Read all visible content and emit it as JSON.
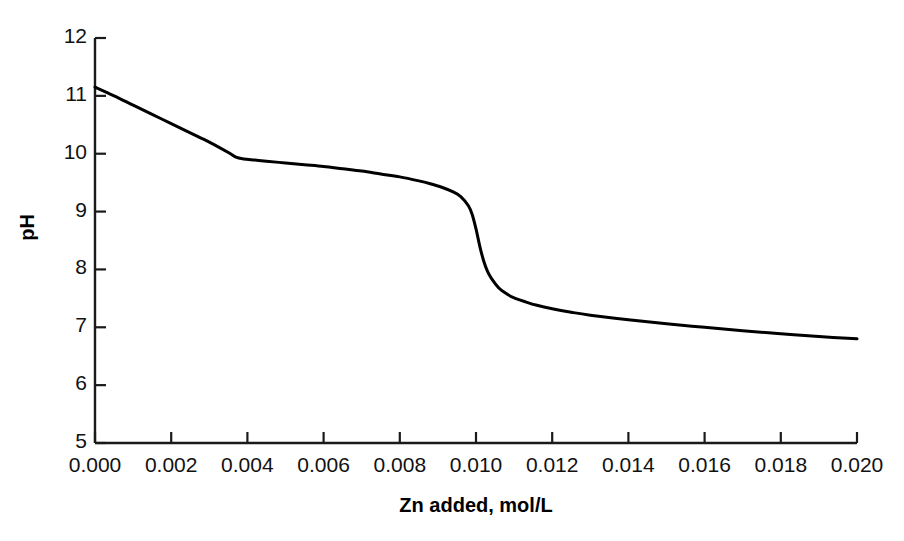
{
  "chart_data": {
    "type": "line",
    "title": "",
    "xlabel": "Zn added, mol/L",
    "ylabel": "pH",
    "xlim": [
      0.0,
      0.02
    ],
    "ylim": [
      5,
      12
    ],
    "grid": false,
    "legend": null,
    "x_ticks": [
      0.0,
      0.002,
      0.004,
      0.006,
      0.008,
      0.01,
      0.012,
      0.014,
      0.016,
      0.018,
      0.02
    ],
    "x_tick_labels": [
      "0.000",
      "0.002",
      "0.004",
      "0.006",
      "0.008",
      "0.010",
      "0.012",
      "0.014",
      "0.016",
      "0.018",
      "0.020"
    ],
    "y_ticks": [
      5,
      6,
      7,
      8,
      9,
      10,
      11,
      12
    ],
    "y_tick_labels": [
      "5",
      "6",
      "7",
      "8",
      "9",
      "10",
      "11",
      "12"
    ],
    "series": [
      {
        "name": "titration curve",
        "color": "#000000",
        "line_width": 3,
        "x": [
          0.0,
          0.0005,
          0.001,
          0.0015,
          0.002,
          0.0025,
          0.003,
          0.0035,
          0.0037,
          0.0039,
          0.0042,
          0.0045,
          0.005,
          0.0055,
          0.006,
          0.0065,
          0.007,
          0.0075,
          0.008,
          0.0085,
          0.0088,
          0.0091,
          0.0094,
          0.0096,
          0.0098,
          0.0099,
          0.01,
          0.0101,
          0.0102,
          0.0103,
          0.0104,
          0.0106,
          0.0108,
          0.011,
          0.0113,
          0.0116,
          0.012,
          0.0125,
          0.013,
          0.014,
          0.015,
          0.016,
          0.017,
          0.018,
          0.019,
          0.02
        ],
        "y": [
          11.15,
          11.0,
          10.84,
          10.68,
          10.52,
          10.36,
          10.2,
          10.02,
          9.94,
          9.91,
          9.89,
          9.87,
          9.84,
          9.81,
          9.78,
          9.74,
          9.7,
          9.65,
          9.6,
          9.53,
          9.48,
          9.42,
          9.34,
          9.26,
          9.1,
          8.95,
          8.7,
          8.4,
          8.15,
          7.97,
          7.85,
          7.68,
          7.58,
          7.51,
          7.44,
          7.38,
          7.32,
          7.26,
          7.21,
          7.13,
          7.06,
          7.0,
          6.94,
          6.89,
          6.84,
          6.8
        ]
      }
    ]
  },
  "axes": {
    "y_title": "pH",
    "x_title": "Zn added, mol/L"
  }
}
